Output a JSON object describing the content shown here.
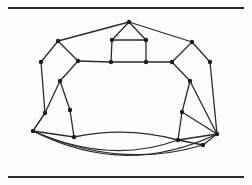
{
  "page": {
    "background_color": "#fdfdfc",
    "ink_color": "#2b2b2b",
    "rules": {
      "top_label": "top-horizontal-rule",
      "bottom_label": "bottom-horizontal-rule"
    }
  },
  "figure": {
    "name": "polyhedral-graph-drawing",
    "caption": "",
    "style": {
      "stroke": "#2b2b2b",
      "stroke_width": 1.3,
      "vertex_fill": "#1e1e1e",
      "vertex_radius": 2.2
    },
    "vertices": [
      {
        "id": "v0",
        "name": "apex",
        "x": 129,
        "y": 22
      },
      {
        "id": "v1",
        "name": "inner-top-left",
        "x": 112,
        "y": 40
      },
      {
        "id": "v2",
        "name": "inner-top-right",
        "x": 146,
        "y": 40
      },
      {
        "id": "v3",
        "name": "inner-mid-left",
        "x": 111,
        "y": 62
      },
      {
        "id": "v4",
        "name": "inner-mid-right",
        "x": 146,
        "y": 62
      },
      {
        "id": "v5",
        "name": "upper-left-outer",
        "x": 58,
        "y": 41
      },
      {
        "id": "v6",
        "name": "upper-left-inner",
        "x": 78,
        "y": 61
      },
      {
        "id": "v7",
        "name": "left-outer-upper",
        "x": 41,
        "y": 62
      },
      {
        "id": "v8",
        "name": "left-inner-mid",
        "x": 60,
        "y": 81
      },
      {
        "id": "v9",
        "name": "left-outer-lower",
        "x": 45,
        "y": 113
      },
      {
        "id": "v10",
        "name": "left-inner-lower",
        "x": 70,
        "y": 110
      },
      {
        "id": "v11",
        "name": "left-apex-far",
        "x": 33,
        "y": 131
      },
      {
        "id": "v12",
        "name": "left-bottom-inner",
        "x": 74,
        "y": 137
      },
      {
        "id": "v13",
        "name": "upper-right-outer",
        "x": 192,
        "y": 42
      },
      {
        "id": "v14",
        "name": "upper-right-inner",
        "x": 172,
        "y": 62
      },
      {
        "id": "v15",
        "name": "right-outer-upper",
        "x": 210,
        "y": 62
      },
      {
        "id": "v16",
        "name": "right-inner-mid",
        "x": 190,
        "y": 81
      },
      {
        "id": "v17",
        "name": "right-inner-lower",
        "x": 182,
        "y": 112
      },
      {
        "id": "v18",
        "name": "right-apex-far",
        "x": 217,
        "y": 134
      },
      {
        "id": "v19",
        "name": "right-bottom-inner",
        "x": 178,
        "y": 140
      },
      {
        "id": "v20",
        "name": "bottom-right-tail",
        "x": 203,
        "y": 145
      }
    ],
    "straight_edges": [
      [
        "v0",
        "v1"
      ],
      [
        "v0",
        "v2"
      ],
      [
        "v1",
        "v2"
      ],
      [
        "v1",
        "v3"
      ],
      [
        "v2",
        "v4"
      ],
      [
        "v3",
        "v4"
      ],
      [
        "v0",
        "v5"
      ],
      [
        "v0",
        "v13"
      ],
      [
        "v5",
        "v6"
      ],
      [
        "v5",
        "v7"
      ],
      [
        "v6",
        "v3"
      ],
      [
        "v6",
        "v8"
      ],
      [
        "v7",
        "v9"
      ],
      [
        "v8",
        "v10"
      ],
      [
        "v9",
        "v11"
      ],
      [
        "v8",
        "v9"
      ],
      [
        "v10",
        "v12"
      ],
      [
        "v11",
        "v12"
      ],
      [
        "v13",
        "v14"
      ],
      [
        "v13",
        "v15"
      ],
      [
        "v14",
        "v4"
      ],
      [
        "v14",
        "v16"
      ],
      [
        "v15",
        "v18"
      ],
      [
        "v16",
        "v17"
      ],
      [
        "v16",
        "v18"
      ],
      [
        "v17",
        "v18"
      ],
      [
        "v17",
        "v19"
      ],
      [
        "v19",
        "v20"
      ],
      [
        "v18",
        "v20"
      ],
      [
        "v19",
        "v18"
      ],
      [
        "v11",
        "v9"
      ]
    ],
    "curved_edges": [
      {
        "name": "lower-outer-arc",
        "from": "v11",
        "to": "v18",
        "control": [
          125,
          178
        ]
      },
      {
        "name": "lower-inner-arc",
        "from": "v11",
        "to": "v20",
        "control": [
          120,
          170
        ]
      },
      {
        "name": "upper-belly-arc",
        "from": "v12",
        "to": "v19",
        "control": [
          126,
          126
        ]
      },
      {
        "name": "left-belly-arc",
        "from": "v11",
        "to": "v19",
        "control": [
          110,
          165
        ]
      }
    ]
  }
}
